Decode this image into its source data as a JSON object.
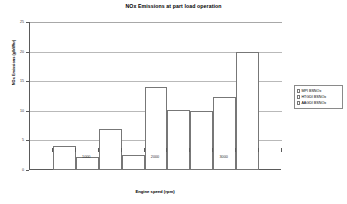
{
  "chart_data": {
    "type": "bar",
    "title": "NOx Emissions at part load operation",
    "xlabel": "Engine speed (rpm)",
    "ylabel": "NOx Emissions (g/kWhr)",
    "categories": [
      "1000",
      "2000",
      "3000"
    ],
    "series": [
      {
        "name": "MPI BSNOx",
        "values": [
          4.0,
          2.5,
          10.0
        ]
      },
      {
        "name": "HTGDI BSNOx",
        "values": [
          2.2,
          14.0,
          12.3
        ]
      },
      {
        "name": "AAGDI BSNOx",
        "values": [
          7.0,
          10.1,
          20.0
        ]
      }
    ],
    "ylim": [
      0,
      25
    ],
    "yticks": [
      0,
      5,
      10,
      15,
      20,
      25
    ],
    "ytick_labels": [
      "0",
      "5",
      "10",
      "15",
      "20",
      "25"
    ],
    "grid": true,
    "grid_axis": "y",
    "legend_position": "right",
    "bar_fill": "#ffffff",
    "bar_border": "#777777",
    "grid_color": "#b9b9b9",
    "axis_color": "#5a5a5a",
    "background": "#ffffff"
  }
}
